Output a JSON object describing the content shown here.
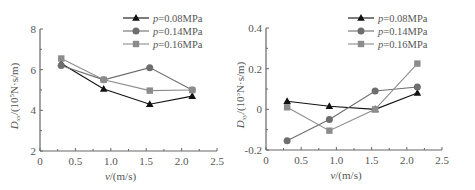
{
  "chart_data": [
    {
      "type": "line",
      "title": "",
      "xlabel": "v/(m/s)",
      "ylabel": "D_xx/(10^5N·s/m)",
      "xlim": [
        0,
        2.5
      ],
      "ylim": [
        2,
        8
      ],
      "xticks": [
        "0",
        "0.5",
        "1.0",
        "1.5",
        "2.0",
        "2.5"
      ],
      "yticks": [
        "2",
        "4",
        "6",
        "8"
      ],
      "legend_position": "upper right",
      "grid": false,
      "x": [
        0.3,
        0.9,
        1.55,
        2.15
      ],
      "series": [
        {
          "name": "p=0.08MPa",
          "marker": "triangle",
          "color": "#111111",
          "values": [
            6.3,
            5.05,
            4.3,
            4.7
          ]
        },
        {
          "name": "p=0.14MPa",
          "marker": "circle",
          "color": "#6e6e6e",
          "values": [
            6.2,
            5.5,
            6.1,
            5.0
          ]
        },
        {
          "name": "p=0.16MPa",
          "marker": "square",
          "color": "#8c8c8c",
          "values": [
            6.55,
            5.5,
            4.97,
            5.0
          ]
        }
      ]
    },
    {
      "type": "line",
      "title": "",
      "xlabel": "v/(m/s)",
      "ylabel": "D_xy/(10^5N·s/m)",
      "xlim": [
        0,
        2.5
      ],
      "ylim": [
        -0.2,
        0.4
      ],
      "xticks": [
        "0",
        "0.5",
        "1.0",
        "1.5",
        "2.0",
        "2.5"
      ],
      "yticks": [
        "-0.2",
        "0",
        "0.2",
        "0.4"
      ],
      "legend_position": "upper right",
      "grid": false,
      "x": [
        0.3,
        0.9,
        1.55,
        2.15
      ],
      "series": [
        {
          "name": "p=0.08MPa",
          "marker": "triangle",
          "color": "#111111",
          "values": [
            0.04,
            0.015,
            0.0,
            0.08
          ]
        },
        {
          "name": "p=0.14MPa",
          "marker": "circle",
          "color": "#6e6e6e",
          "values": [
            -0.155,
            -0.05,
            0.09,
            0.11
          ]
        },
        {
          "name": "p=0.16MPa",
          "marker": "square",
          "color": "#8c8c8c",
          "values": [
            0.01,
            -0.105,
            0.0,
            0.225
          ]
        }
      ]
    }
  ]
}
